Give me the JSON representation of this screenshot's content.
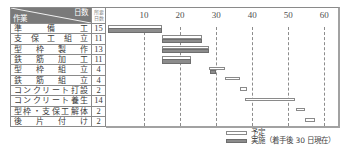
{
  "table": {
    "header": {
      "days_label": "日数",
      "task_label": "作業",
      "duration_label_line1": "所要",
      "duration_label_line2": "日数"
    },
    "rows": [
      {
        "task": "準備工",
        "days": "15"
      },
      {
        "task": "支保工組立",
        "days": "11"
      },
      {
        "task": "型枠製作",
        "days": "13"
      },
      {
        "task": "鉄筋加工",
        "days": "11"
      },
      {
        "task": "型枠組立",
        "days": "4"
      },
      {
        "task": "鉄筋組立",
        "days": "4"
      },
      {
        "task": "コンクリート打設",
        "days": "2"
      },
      {
        "task": "コンクリート養生",
        "days": "14"
      },
      {
        "task": "型枠・支保工解体",
        "days": "2"
      },
      {
        "task": "後片付け",
        "days": "2"
      }
    ]
  },
  "legend": {
    "plan": "予定",
    "actual": "実施（着手後 30 日現在）"
  },
  "chart_data": {
    "type": "bar",
    "orientation": "horizontal (gantt)",
    "title": "",
    "xlabel": "日数",
    "ylabel": "作業",
    "xlim": [
      0,
      60
    ],
    "x_ticks": [
      "10",
      "20",
      "30",
      "40",
      "50",
      "60"
    ],
    "x_tick_values": [
      10,
      20,
      30,
      40,
      50,
      60
    ],
    "grid": "vertical dashed lines at x ticks",
    "legend_position": "bottom-right",
    "categories": [
      "準備工",
      "支保工組立",
      "型枠製作",
      "鉄筋加工",
      "型枠組立",
      "鉄筋組立",
      "コンクリート打設",
      "コンクリート養生",
      "型枠・支保工解体",
      "後片付け"
    ],
    "durations": [
      15,
      11,
      13,
      11,
      4,
      4,
      2,
      14,
      2,
      2
    ],
    "series": [
      {
        "name": "予定",
        "style": "white bar with gray outline",
        "values": [
          [
            0,
            15
          ],
          [
            15,
            26
          ],
          [
            15,
            28
          ],
          [
            15,
            23
          ],
          [
            28,
            32.5
          ],
          [
            32.5,
            36.5
          ],
          [
            36.5,
            38.5
          ],
          [
            38,
            52
          ],
          [
            52,
            54.7
          ],
          [
            54.7,
            57.5
          ]
        ]
      },
      {
        "name": "実施（着手後 30 日現在）",
        "style": "gray filled bar",
        "values": [
          [
            0,
            15
          ],
          [
            15,
            26
          ],
          [
            15,
            28
          ],
          [
            15,
            23
          ],
          [
            28.3,
            30
          ],
          null,
          null,
          null,
          null,
          null
        ]
      }
    ],
    "colors": {
      "plan_fill": "#ffffff",
      "plan_border": "#8a8a8a",
      "actual_fill": "#8c8c8c",
      "header_bg": "#7a7a7a"
    }
  }
}
